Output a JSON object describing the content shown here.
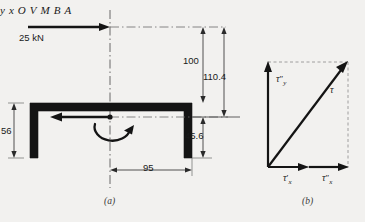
{
  "figure": {
    "background_color": "#f2f1ef",
    "ink_color": "#141414",
    "panels": [
      {
        "caption": "(a)",
        "name": "channel-section-free-body"
      },
      {
        "caption": "(b)",
        "name": "shear-stress-vector-sum"
      }
    ]
  },
  "panel_a": {
    "applied_load_label": "25 kN",
    "axis_y_label": "y",
    "axis_x_label": "x",
    "origin_label": "O",
    "shear_force_label": "V",
    "moment_label": "M",
    "point_b_label": "B",
    "point_a_label": "A",
    "dimensions": [
      {
        "name": "dim-100",
        "value": "100"
      },
      {
        "name": "dim-110-4",
        "value": "110.4"
      },
      {
        "name": "dim-45-6",
        "value": "45.6"
      },
      {
        "name": "dim-56",
        "value": "56"
      },
      {
        "name": "dim-95",
        "value": "95"
      }
    ]
  },
  "panel_b": {
    "tau_y_double_prime": {
      "symbol": "τ",
      "prime": "″",
      "sub": "y"
    },
    "tau_x_prime": {
      "symbol": "τ",
      "prime": "′",
      "sub": "x"
    },
    "tau_x_double_prime": {
      "symbol": "τ",
      "prime": "″",
      "sub": "x"
    },
    "tau_resultant": {
      "symbol": "τ",
      "prime": "",
      "sub": ""
    }
  },
  "captions": {
    "a": "(a)",
    "b": "(b)"
  }
}
